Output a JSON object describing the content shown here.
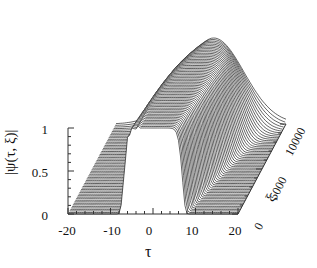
{
  "chart_data": {
    "type": "surface-waterfall",
    "title": "",
    "xlabel": "τ",
    "ylabel": "|ψ(τ, ξ)|",
    "zlabel": "ξ",
    "x_ticks": [
      "-20",
      "-10",
      "0",
      "10",
      "20"
    ],
    "y_ticks": [
      "0",
      "0.5",
      "1"
    ],
    "z_ticks": [
      "0",
      "5000",
      "10000"
    ],
    "xlim": [
      -20,
      20
    ],
    "ylim": [
      0,
      1
    ],
    "zlim": [
      0,
      10000
    ],
    "series": [
      {
        "name": "xi=0",
        "x": [
          -20,
          -12,
          -10,
          -8,
          -5,
          0,
          5,
          8,
          10,
          12,
          20
        ],
        "values": [
          0,
          0,
          0.05,
          0.6,
          1.0,
          1.0,
          1.0,
          0.6,
          0.05,
          0,
          0
        ]
      },
      {
        "name": "xi=10000",
        "x": [
          -20,
          -10,
          -5,
          0,
          5,
          10,
          20
        ],
        "values": [
          0.05,
          0.2,
          0.6,
          1.0,
          0.6,
          0.2,
          0.05
        ]
      }
    ],
    "grid": false,
    "legend": null
  },
  "axes": {
    "y_ticks": [
      "1",
      "0.5",
      "0"
    ],
    "x_ticks": [
      "-20",
      "-10",
      "0",
      "10",
      "20"
    ],
    "z_ticks": [
      "0",
      "5000",
      "10000"
    ],
    "xlabel": "τ",
    "ylabel": "|ψ(τ, ξ)|",
    "zlabel": "ξ"
  }
}
